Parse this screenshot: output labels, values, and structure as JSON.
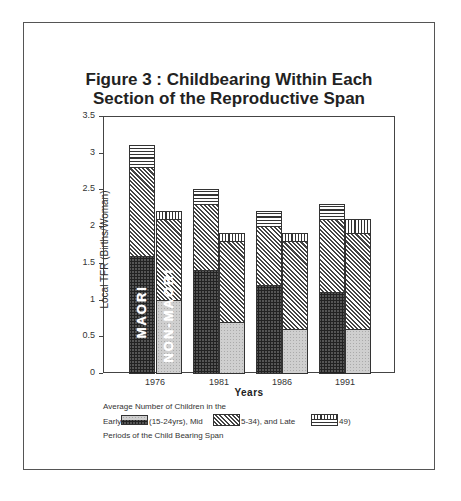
{
  "chart_data": {
    "type": "bar",
    "stacked": true,
    "grouped": true,
    "title": "Figure 3 : Childbearing Within Each Section of the Reproductive Span",
    "xlabel": "Years",
    "ylabel": "Local TFR (Births/Woman)",
    "ylim": [
      0,
      3.5
    ],
    "yticks": [
      "0",
      "0.5",
      "1",
      "1.5",
      "2",
      "2.5",
      "3",
      "3.5"
    ],
    "categories": [
      "1976",
      "1981",
      "1986",
      "1991"
    ],
    "groups": [
      "MAORI",
      "NON-MAORI"
    ],
    "series": [
      {
        "name": "Early (15-24yrs)",
        "group": "MAORI",
        "values": [
          1.6,
          1.4,
          1.2,
          1.1
        ]
      },
      {
        "name": "Mid (25-34)",
        "group": "MAORI",
        "values": [
          1.2,
          0.9,
          0.8,
          1.0
        ]
      },
      {
        "name": "Late (35-49)",
        "group": "MAORI",
        "values": [
          0.3,
          0.2,
          0.2,
          0.2
        ]
      },
      {
        "name": "Early (15-24yrs)",
        "group": "NON-MAORI",
        "values": [
          1.0,
          0.7,
          0.6,
          0.6
        ]
      },
      {
        "name": "Mid (25-34)",
        "group": "NON-MAORI",
        "values": [
          1.1,
          1.1,
          1.2,
          1.3
        ]
      },
      {
        "name": "Late (35-49)",
        "group": "NON-MAORI",
        "values": [
          0.1,
          0.1,
          0.1,
          0.2
        ]
      }
    ],
    "totals": {
      "MAORI": [
        3.1,
        2.5,
        2.2,
        2.3
      ],
      "NON-MAORI": [
        2.2,
        1.9,
        1.9,
        2.1
      ]
    },
    "grid": false,
    "legend_position": "bottom"
  },
  "title_line1": "Figure 3 : Childbearing Within Each",
  "title_line2": "Section of the Reproductive Span",
  "group_labels": {
    "maori": "MAORI",
    "non_maori": "NON-MAORI"
  },
  "legend": {
    "line1": "Average Number of Children in the",
    "early_prefix": "Early",
    "early_suffix": "(15-24yrs),  Mid",
    "mid_suffix": "5-34), and Late",
    "late_suffix": "49)",
    "line3": "Periods of the Child Bearing Span"
  }
}
